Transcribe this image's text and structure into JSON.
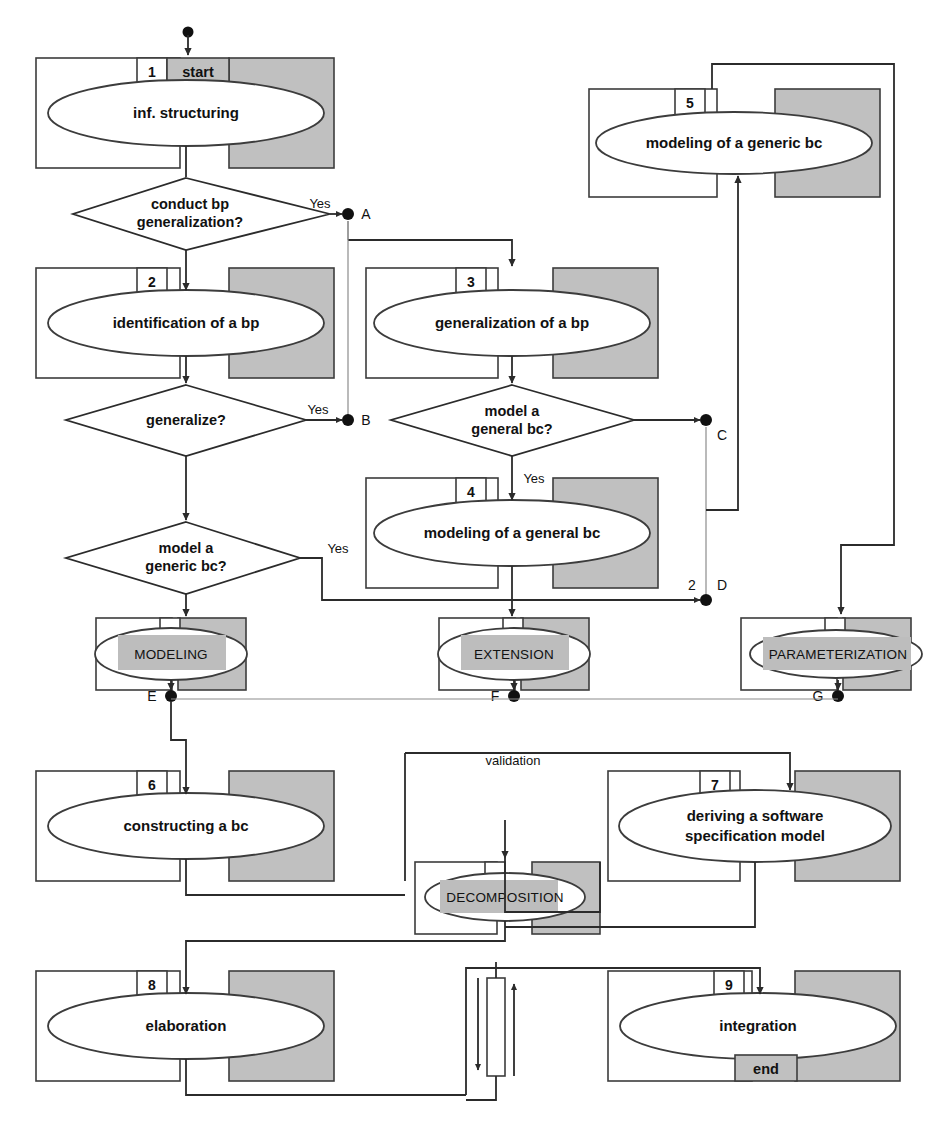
{
  "diagram": {
    "colors": {
      "stroke": "#2b2b2b",
      "gray_fill": "#c0c0c0",
      "band_gray": "#bdbdbd",
      "white": "#ffffff",
      "thin_line": "#8c8c8c"
    },
    "process_nodes": [
      {
        "id": "n1",
        "number": "1",
        "label": "inf. structuring",
        "tag": "start"
      },
      {
        "id": "n2",
        "number": "2",
        "label": "identification of a bp",
        "tag": ""
      },
      {
        "id": "n3",
        "number": "3",
        "label": "generalization of a bp",
        "tag": ""
      },
      {
        "id": "n4",
        "number": "4",
        "label": "modeling of a general bc",
        "tag": ""
      },
      {
        "id": "n5",
        "number": "5",
        "label": "modeling of a generic bc",
        "tag": ""
      },
      {
        "id": "n6",
        "number": "6",
        "label": "constructing a bc",
        "tag": ""
      },
      {
        "id": "n7",
        "number": "7",
        "label": "deriving a software",
        "label2": "specification model",
        "tag": ""
      },
      {
        "id": "n8",
        "number": "8",
        "label": "elaboration",
        "tag": ""
      },
      {
        "id": "n9",
        "number": "9",
        "label": "integration",
        "tag": "end"
      }
    ],
    "subprocess_nodes": [
      {
        "id": "s1",
        "label": "MODELING"
      },
      {
        "id": "s2",
        "label": "EXTENSION"
      },
      {
        "id": "s3",
        "label": "PARAMETERIZATION"
      },
      {
        "id": "s4",
        "label": "DECOMPOSITION"
      }
    ],
    "decisions": [
      {
        "id": "d1",
        "line1": "conduct bp",
        "line2": "generalization?"
      },
      {
        "id": "d2",
        "line1": "generalize?",
        "line2": ""
      },
      {
        "id": "d3",
        "line1": "model a",
        "line2": "generic bc?"
      },
      {
        "id": "d4",
        "line1": "model a",
        "line2": "general bc?"
      }
    ],
    "connectors": [
      {
        "id": "A",
        "label": "A"
      },
      {
        "id": "B",
        "label": "B"
      },
      {
        "id": "C",
        "label": "C"
      },
      {
        "id": "D",
        "label": "D"
      },
      {
        "id": "E",
        "label": "E"
      },
      {
        "id": "F",
        "label": "F"
      },
      {
        "id": "G",
        "label": "G"
      }
    ],
    "edge_labels": [
      {
        "id": "yes-d1",
        "text": "Yes"
      },
      {
        "id": "yes-d2",
        "text": "Yes"
      },
      {
        "id": "yes-d3",
        "text": "Yes"
      },
      {
        "id": "yes-d4",
        "text": "Yes"
      },
      {
        "id": "validation",
        "text": "validation"
      },
      {
        "id": "mult-2",
        "text": "2"
      }
    ]
  }
}
